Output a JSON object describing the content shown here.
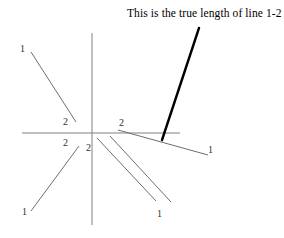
{
  "figure": {
    "caption": "This is the true length of line 1-2",
    "background_color": "#ffffff",
    "axis_color": "#808080",
    "line_color": "#6e6e6e",
    "emphasis_color": "#000000",
    "label_color": "#2e2e2e",
    "axes": {
      "name": "reference-axes",
      "origin": [
        92,
        133
      ],
      "horizontal": {
        "x1": 22,
        "y1": 133,
        "x2": 180,
        "y2": 133
      },
      "vertical": {
        "x1": 92,
        "y1": 33,
        "x2": 92,
        "y2": 225
      }
    },
    "views": [
      {
        "id": "upper-left-view",
        "quadrant": "upper-left",
        "line": {
          "x1": 31,
          "y1": 52,
          "x2": 76,
          "y2": 122
        },
        "endpoints": [
          {
            "label": "1",
            "x": 20,
            "y": 44
          },
          {
            "label": "2",
            "x": 63,
            "y": 117
          }
        ]
      },
      {
        "id": "lower-left-view",
        "quadrant": "lower-left",
        "line": {
          "x1": 31,
          "y1": 211,
          "x2": 79,
          "y2": 146
        },
        "endpoints": [
          {
            "label": "1",
            "x": 22,
            "y": 207
          },
          {
            "label": "2",
            "x": 63,
            "y": 138
          }
        ]
      },
      {
        "id": "lower-right-view-a",
        "quadrant": "lower-right",
        "line": {
          "x1": 97,
          "y1": 138,
          "x2": 156,
          "y2": 201
        },
        "endpoints": [
          {
            "label": "2",
            "x": 86,
            "y": 143
          },
          {
            "label": "1",
            "x": 157,
            "y": 209
          }
        ]
      },
      {
        "id": "lower-right-view-b",
        "quadrant": "lower-right",
        "line": {
          "x1": 110,
          "y1": 136,
          "x2": 171,
          "y2": 202
        },
        "endpoints": []
      },
      {
        "id": "right-horizontal-view",
        "quadrant": "right",
        "line": {
          "x1": 118,
          "y1": 130,
          "x2": 208,
          "y2": 155
        },
        "endpoints": [
          {
            "label": "2",
            "x": 119,
            "y": 118
          },
          {
            "label": "1",
            "x": 208,
            "y": 145
          }
        ]
      },
      {
        "id": "true-length-line",
        "quadrant": "upper-right",
        "emphasized": true,
        "line": {
          "x1": 199,
          "y1": 28,
          "x2": 162,
          "y2": 140
        },
        "endpoints": []
      }
    ]
  }
}
